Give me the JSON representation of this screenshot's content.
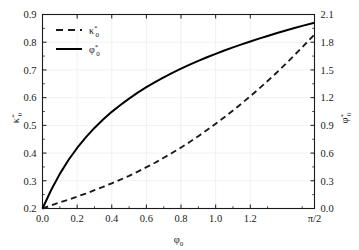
{
  "chart_data": {
    "type": "line",
    "title": "",
    "xlabel": "φ₀",
    "ylabel_left": "κ*₀",
    "ylabel_right": "φ*₀",
    "grid": true,
    "legend_position": "top-left",
    "xlim": [
      0.0,
      1.5708
    ],
    "xticks": [
      0.0,
      0.2,
      0.4,
      0.6,
      0.8,
      1.0,
      1.2,
      1.5708
    ],
    "xticklabels": [
      "0.0",
      "0.2",
      "0.4",
      "0.6",
      "0.8",
      "1.0",
      "1.2",
      "π/2"
    ],
    "ylim_left": [
      0.2,
      0.9
    ],
    "yticks_left": [
      0.2,
      0.3,
      0.4,
      0.5,
      0.6,
      0.7,
      0.8,
      0.9
    ],
    "yticklabels_left": [
      "0.2",
      "0.3",
      "0.4",
      "0.5",
      "0.6",
      "0.7",
      "0.8",
      "0.9"
    ],
    "ylim_right": [
      0.0,
      2.1
    ],
    "yticks_right": [
      0.0,
      0.3,
      0.6,
      0.9,
      1.2,
      1.5,
      1.8,
      2.1
    ],
    "yticklabels_right": [
      "0.0",
      "0.3",
      "0.6",
      "0.9",
      "1.2",
      "1.5",
      "1.8",
      "2.1"
    ],
    "series": [
      {
        "name": "κ*₀",
        "axis": "left",
        "style": "dashed",
        "color": "#1a1a1a",
        "x": [
          0.0,
          0.05,
          0.1,
          0.15,
          0.2,
          0.25,
          0.3,
          0.35,
          0.4,
          0.45,
          0.5,
          0.55,
          0.6,
          0.65,
          0.7,
          0.75,
          0.8,
          0.85,
          0.9,
          0.95,
          1.0,
          1.05,
          1.1,
          1.15,
          1.2,
          1.25,
          1.3,
          1.35,
          1.4,
          1.45,
          1.5,
          1.5708
        ],
        "values": [
          0.2,
          0.211,
          0.222,
          0.232,
          0.243,
          0.254,
          0.266,
          0.278,
          0.291,
          0.304,
          0.318,
          0.333,
          0.349,
          0.365,
          0.383,
          0.401,
          0.42,
          0.44,
          0.461,
          0.483,
          0.506,
          0.529,
          0.554,
          0.579,
          0.605,
          0.632,
          0.66,
          0.689,
          0.719,
          0.75,
          0.782,
          0.828
        ]
      },
      {
        "name": "φ*₀",
        "axis": "right",
        "style": "solid",
        "color": "#000000",
        "x": [
          0.0,
          0.05,
          0.1,
          0.15,
          0.2,
          0.25,
          0.3,
          0.35,
          0.4,
          0.45,
          0.5,
          0.55,
          0.6,
          0.65,
          0.7,
          0.75,
          0.8,
          0.85,
          0.9,
          0.95,
          1.0,
          1.05,
          1.1,
          1.15,
          1.2,
          1.25,
          1.3,
          1.35,
          1.4,
          1.45,
          1.5,
          1.5708
        ],
        "values": [
          0.0,
          0.2,
          0.375,
          0.525,
          0.655,
          0.77,
          0.872,
          0.963,
          1.046,
          1.121,
          1.19,
          1.254,
          1.313,
          1.368,
          1.42,
          1.468,
          1.514,
          1.557,
          1.598,
          1.637,
          1.674,
          1.71,
          1.744,
          1.777,
          1.808,
          1.839,
          1.868,
          1.897,
          1.925,
          1.951,
          1.977,
          2.01
        ]
      }
    ],
    "legend": [
      {
        "label": "κ*₀",
        "style": "dashed"
      },
      {
        "label": "φ*₀",
        "style": "solid"
      }
    ]
  }
}
